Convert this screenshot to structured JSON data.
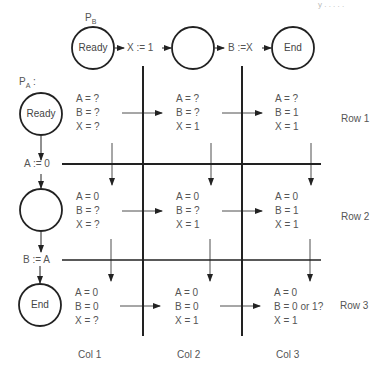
{
  "header_fragment": "y      . . . . .",
  "process_b": {
    "label": "P",
    "label_sub": "B",
    "states": [
      "Ready",
      "",
      "End"
    ],
    "transitions": [
      "X := 1",
      "B :=X"
    ]
  },
  "process_a": {
    "label": "P",
    "label_sub": "A",
    "label_suffix": " :",
    "states": [
      "Ready",
      "",
      "End"
    ],
    "transitions": [
      "A := 0",
      "B := A"
    ]
  },
  "grid": {
    "rows": [
      {
        "label": "Row 1",
        "cells": [
          {
            "A": "A = ?",
            "B": "B = ?",
            "X": "X = ?"
          },
          {
            "A": "A = ?",
            "B": "B = ?",
            "X": "X = 1"
          },
          {
            "A": "A = ?",
            "B": "B = 1",
            "X": "X = 1"
          }
        ]
      },
      {
        "label": "Row 2",
        "cells": [
          {
            "A": "A = 0",
            "B": "B = ?",
            "X": "X = ?"
          },
          {
            "A": "A = 0",
            "B": "B = ?",
            "X": "X = 1"
          },
          {
            "A": "A = 0",
            "B": "B = 1",
            "X": "X = 1"
          }
        ]
      },
      {
        "label": "Row 3",
        "cells": [
          {
            "A": "A = 0",
            "B": "B = 0",
            "X": "X = ?"
          },
          {
            "A": "A = 0",
            "B": "B = 0",
            "X": "X = 1"
          },
          {
            "A": "A = 0",
            "B": "B = 0 or 1?",
            "X": "X = 1"
          }
        ]
      }
    ],
    "columns": [
      "Col 1",
      "Col 2",
      "Col 3"
    ]
  },
  "colors": {
    "line": "#222222",
    "text": "#555555"
  }
}
